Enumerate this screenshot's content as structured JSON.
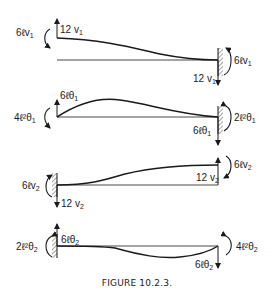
{
  "figure": {
    "caption": "FIGURE 10.2.3.",
    "panels": [
      {
        "id": "panel-v1",
        "description": "Cantilever fixed at right, unit displacement v1 at left end",
        "left_moment": {
          "coef": "6",
          "sym": "ℓv",
          "sub": "1"
        },
        "left_force": {
          "coef": "12 ",
          "sym": "v",
          "sub": "1"
        },
        "right_moment": {
          "coef": "6",
          "sym": "ℓv",
          "sub": "1"
        },
        "right_force": {
          "coef": "12 ",
          "sym": "v",
          "sub": "1"
        }
      },
      {
        "id": "panel-theta1",
        "description": "Fixed at right, unit rotation theta1 at left end",
        "left_moment": {
          "coef": "4",
          "sym": "ℓ²θ",
          "sub": "1"
        },
        "left_force": {
          "coef": "6",
          "sym": "ℓθ",
          "sub": "1"
        },
        "right_moment": {
          "coef": "2",
          "sym": "ℓ²θ",
          "sub": "1"
        },
        "right_force": {
          "coef": "6",
          "sym": "ℓθ",
          "sub": "1"
        }
      },
      {
        "id": "panel-v2",
        "description": "Fixed at left, unit displacement v2 at right end",
        "left_moment": {
          "coef": "6",
          "sym": "ℓv",
          "sub": "2"
        },
        "left_force": {
          "coef": "12 ",
          "sym": "v",
          "sub": "2"
        },
        "right_moment": {
          "coef": "6",
          "sym": "ℓv",
          "sub": "2"
        },
        "right_force": {
          "coef": "12 ",
          "sym": "v",
          "sub": "2"
        }
      },
      {
        "id": "panel-theta2",
        "description": "Fixed at left, unit rotation theta2 at right end",
        "left_moment": {
          "coef": "2",
          "sym": "ℓ²θ",
          "sub": "2"
        },
        "left_force": {
          "coef": "6",
          "sym": "ℓθ",
          "sub": "2"
        },
        "right_moment": {
          "coef": "4",
          "sym": "ℓ²θ",
          "sub": "2"
        },
        "right_force": {
          "coef": "6",
          "sym": "ℓθ",
          "sub": "2"
        }
      }
    ]
  },
  "colors": {
    "ink": "#1a1a1a",
    "background": "#ffffff"
  }
}
